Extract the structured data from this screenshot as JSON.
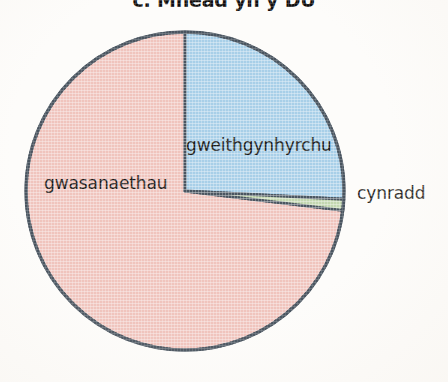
{
  "title": "c. Mhead yn y DU",
  "labels": {
    "gweithgynhyrchu": "gweithgynhyrchu",
    "gwasanaethau": "gwasanaethau",
    "cynradd": "cynradd"
  },
  "colors": {
    "manufacturing": "#a8cfe8",
    "primary": "#c3d7b0",
    "services": "#f0c4bd",
    "outline": "#4a5560",
    "text": "#1b1a18",
    "background": "#fdfcfa"
  },
  "chart_data": {
    "type": "pie",
    "title": "c. Mhead yn y DU",
    "categories": [
      "gweithgynhyrchu",
      "cynradd",
      "gwasanaethau"
    ],
    "values": [
      25.8,
      1.1,
      73.1
    ],
    "units": "percent",
    "slice_angles_deg": [
      {
        "name": "gweithgynhyrchu",
        "start": 0,
        "end": 93
      },
      {
        "name": "cynradd",
        "start": 93,
        "end": 97
      },
      {
        "name": "gwasanaethau",
        "start": 97,
        "end": 360
      }
    ],
    "colors": [
      "#a8cfe8",
      "#c3d7b0",
      "#f0c4bd"
    ],
    "start_angle": 0,
    "direction": "clockwise",
    "legend": "none",
    "labels_position": "on-slice",
    "annotations": [
      {
        "text": "gweithgynhyrchu",
        "slice": "gweithgynhyrchu",
        "placement": "inside"
      },
      {
        "text": "gwasanaethau",
        "slice": "gwasanaethau",
        "placement": "inside"
      },
      {
        "text": "cynradd",
        "slice": "cynradd",
        "placement": "outside-right"
      }
    ],
    "geometry": {
      "center_x": 185,
      "center_y": 191,
      "radius": 159
    }
  }
}
